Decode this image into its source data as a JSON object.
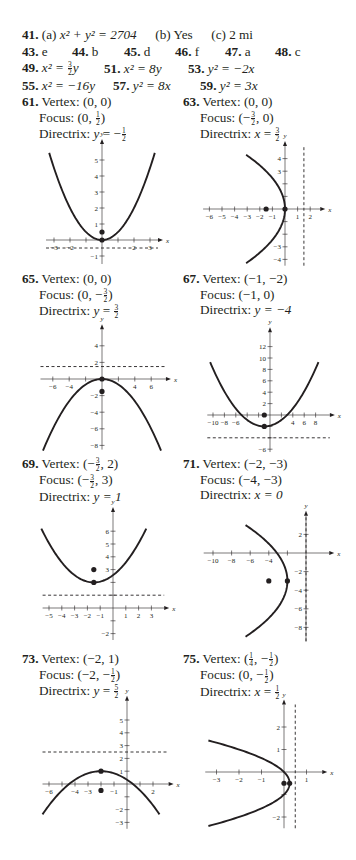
{
  "answers_top": {
    "row1": {
      "items": [
        {
          "num": "41.",
          "parts": [
            "(a)",
            "x² + y² = 2704",
            "(b) Yes",
            "(c) 2 mi"
          ]
        }
      ]
    },
    "row2": {
      "items": [
        {
          "num": "43.",
          "text": "e"
        },
        {
          "num": "44.",
          "text": "b"
        },
        {
          "num": "45.",
          "text": "d"
        },
        {
          "num": "46.",
          "text": "f"
        },
        {
          "num": "47.",
          "text": "a"
        },
        {
          "num": "48.",
          "text": "c"
        }
      ]
    },
    "row3": {
      "items": [
        {
          "num": "49.",
          "lhs": "x² = ",
          "frac_num": "3",
          "frac_den": "2",
          "rhs": "y"
        },
        {
          "num": "51.",
          "text": "x² = 8y"
        },
        {
          "num": "53.",
          "text": "y² = −2x"
        }
      ]
    },
    "row4": {
      "items": [
        {
          "num": "55.",
          "text": "x² = −16y"
        },
        {
          "num": "57.",
          "text": "y² = 8x"
        },
        {
          "num": "59.",
          "text": "y² = 3x"
        }
      ]
    }
  },
  "problems": [
    {
      "num": "61.",
      "vertex": "(0, 0)",
      "focus": {
        "pre": "(0, ",
        "frac_sign": "",
        "frac_num": "1",
        "frac_den": "2",
        "post": ")"
      },
      "directrix": {
        "var": "y",
        "eq": " = −",
        "frac_num": "1",
        "frac_den": "2"
      },
      "labels": {
        "vertex": "Vertex:",
        "focus": "Focus:",
        "directrix": "Directrix:"
      }
    },
    {
      "num": "63.",
      "vertex": "(0, 0)",
      "focus": {
        "pre": "(−",
        "frac_num": "3",
        "frac_den": "2",
        "post": ", 0)"
      },
      "directrix": {
        "var": "x",
        "eq": " = ",
        "frac_num": "3",
        "frac_den": "2"
      },
      "labels": {
        "vertex": "Vertex:",
        "focus": "Focus:",
        "directrix": "Directrix:"
      }
    },
    {
      "num": "65.",
      "vertex": "(0, 0)",
      "focus": {
        "pre": "(0, −",
        "frac_num": "3",
        "frac_den": "2",
        "post": ")"
      },
      "directrix": {
        "var": "y",
        "eq": " = ",
        "frac_num": "3",
        "frac_den": "2"
      },
      "labels": {
        "vertex": "Vertex:",
        "focus": "Focus:",
        "directrix": "Directrix:"
      }
    },
    {
      "num": "67.",
      "vertex": "(−1, −2)",
      "focus_text": "(−1, 0)",
      "directrix_text": "y = −4",
      "labels": {
        "vertex": "Vertex:",
        "focus": "Focus:",
        "directrix": "Directrix:"
      }
    },
    {
      "num": "69.",
      "vertex": {
        "pre": "(−",
        "frac_num": "3",
        "frac_den": "2",
        "post": ", 2)"
      },
      "focus": {
        "pre": "(−",
        "frac_num": "3",
        "frac_den": "2",
        "post": ", 3)"
      },
      "directrix_text": "y = 1",
      "labels": {
        "vertex": "Vertex:",
        "focus": "Focus:",
        "directrix": "Directrix:"
      }
    },
    {
      "num": "71.",
      "vertex": "(−2, −3)",
      "focus_text": "(−4, −3)",
      "directrix_text": "x = 0",
      "labels": {
        "vertex": "Vertex:",
        "focus": "Focus:",
        "directrix": "Directrix:"
      }
    },
    {
      "num": "73.",
      "vertex": "(−2, 1)",
      "focus": {
        "pre": "(−2, −",
        "frac_num": "1",
        "frac_den": "2",
        "post": ")"
      },
      "directrix": {
        "var": "y",
        "eq": " = ",
        "frac_num": "5",
        "frac_den": "2"
      },
      "labels": {
        "vertex": "Vertex:",
        "focus": "Focus:",
        "directrix": "Directrix:"
      }
    },
    {
      "num": "75.",
      "vertex": {
        "pre": "(",
        "frac_num": "1",
        "frac_den": "4",
        "post": ", −",
        "frac2_num": "1",
        "frac2_den": "2",
        "post2": ")"
      },
      "focus": {
        "pre": "(0, −",
        "frac_num": "1",
        "frac_den": "2",
        "post": ")"
      },
      "directrix": {
        "var": "x",
        "eq": " = ",
        "frac_num": "1",
        "frac_den": "2"
      },
      "labels": {
        "vertex": "Vertex:",
        "focus": "Focus:",
        "directrix": "Directrix:"
      }
    }
  ],
  "chart_data": [
    {
      "type": "line",
      "title": "61. x² = 2y",
      "orientation": "vertical",
      "a": 0.5,
      "h": 0,
      "k": 0,
      "vertex": [
        0,
        0
      ],
      "focus": [
        0,
        0.5
      ],
      "directrix": {
        "axis": "y",
        "value": -0.5
      },
      "x_ticks": [
        -3,
        -2,
        -1,
        1,
        2,
        3
      ],
      "x_tick_labels": [
        "-3",
        "-2",
        "2",
        "3"
      ],
      "x_labeled": [
        -3,
        -2,
        2,
        3
      ],
      "y_ticks": [
        -1,
        1,
        2,
        3,
        4,
        5
      ],
      "y_labeled": [
        -1,
        1,
        2,
        3,
        4,
        5
      ],
      "xlim": [
        -3.5,
        3.5
      ],
      "ylim": [
        -1.5,
        6
      ],
      "curve_range": [
        -3.3,
        3.3
      ],
      "xlabel": "x",
      "ylabel": "y"
    },
    {
      "type": "line",
      "title": "63. y² = -6x",
      "orientation": "horizontal",
      "a": -0.1667,
      "h": 0,
      "k": 0,
      "vertex": [
        0,
        0
      ],
      "focus": [
        -1.5,
        0
      ],
      "directrix": {
        "axis": "x",
        "value": 1.5
      },
      "x_ticks": [
        -6,
        -5,
        -4,
        -3,
        -2,
        -1,
        1,
        2
      ],
      "x_labeled": [
        -6,
        -5,
        -4,
        -3,
        -2,
        -1,
        1,
        2
      ],
      "y_ticks": [
        -4,
        -3,
        -2,
        -1,
        1,
        2,
        3,
        4
      ],
      "y_labeled": [
        -4,
        -3,
        3,
        4
      ],
      "xlim": [
        -6.5,
        2.8
      ],
      "ylim": [
        -4.5,
        5
      ],
      "curve_range": [
        -4.3,
        4.3
      ],
      "xlabel": "x",
      "ylabel": "y"
    },
    {
      "type": "line",
      "title": "65. x² = -6y",
      "orientation": "vertical",
      "a": -0.1667,
      "h": 0,
      "k": 0,
      "vertex": [
        0,
        0
      ],
      "focus": [
        0,
        -1.5
      ],
      "directrix": {
        "axis": "y",
        "value": 1.5
      },
      "x_ticks": [
        -6,
        -4,
        -2,
        2,
        4,
        6
      ],
      "x_labeled": [
        -6,
        -4,
        4,
        6
      ],
      "y_ticks": [
        -8,
        -6,
        -4,
        -2,
        2,
        4
      ],
      "y_labeled": [
        -8,
        -6,
        -4,
        -2,
        2,
        4
      ],
      "xlim": [
        -7.5,
        7.8
      ],
      "ylim": [
        -8.5,
        6
      ],
      "curve_range": [
        -7.2,
        7.2
      ],
      "xlabel": "x",
      "ylabel": "y"
    },
    {
      "type": "line",
      "title": "67. (x+1)² = 8(y+2)",
      "orientation": "vertical",
      "a": 0.125,
      "h": -1,
      "k": -2,
      "vertex": [
        -1,
        -2
      ],
      "focus": [
        -1,
        0
      ],
      "directrix": {
        "axis": "y",
        "value": -4
      },
      "x_ticks": [
        -10,
        -8,
        -6,
        -4,
        -2,
        2,
        4,
        6,
        8
      ],
      "x_labeled": [
        -10,
        -8,
        -6,
        4,
        6,
        8
      ],
      "y_ticks": [
        -6,
        -4,
        -2,
        2,
        4,
        6,
        8,
        10,
        12
      ],
      "y_labeled": [
        -6,
        2,
        4,
        6,
        8,
        10,
        12
      ],
      "xlim": [
        -11,
        10.5
      ],
      "ylim": [
        -6.5,
        14.5
      ],
      "curve_range": [
        -10.5,
        8.5
      ],
      "xlabel": "x",
      "ylabel": "y"
    },
    {
      "type": "line",
      "title": "69. (x+3/2)² = 4(y-2)",
      "orientation": "vertical",
      "a": 0.25,
      "h": -1.5,
      "k": 2,
      "vertex": [
        -1.5,
        2
      ],
      "focus": [
        -1.5,
        3
      ],
      "directrix": {
        "axis": "y",
        "value": 1
      },
      "x_ticks": [
        -5,
        -4,
        -3,
        -2,
        -1,
        1,
        2,
        3
      ],
      "x_labeled": [
        -5,
        -4,
        -3,
        -2,
        -1,
        1,
        2,
        3
      ],
      "y_ticks": [
        -2,
        -1,
        1,
        2,
        3,
        4,
        5,
        6
      ],
      "y_labeled": [
        -2,
        3,
        4,
        5,
        6
      ],
      "xlim": [
        -5.5,
        4
      ],
      "ylim": [
        -2.5,
        7.5
      ],
      "curve_range": [
        -5.6,
        2.6
      ],
      "xlabel": "x",
      "ylabel": "y"
    },
    {
      "type": "line",
      "title": "71. (y+3)² = -8(x+2)",
      "orientation": "horizontal",
      "a": -0.125,
      "h": -2,
      "k": -3,
      "vertex": [
        -2,
        -3
      ],
      "focus": [
        -4,
        -3
      ],
      "directrix": {
        "axis": "x",
        "value": 0
      },
      "x_ticks": [
        -10,
        -8,
        -6,
        -4,
        -2
      ],
      "x_labeled": [
        -10,
        -8,
        -6,
        -4
      ],
      "y_ticks": [
        -8,
        -6,
        -4,
        -2,
        2
      ],
      "y_labeled": [
        -8,
        -6,
        -4,
        -2,
        2
      ],
      "xlim": [
        -11,
        2.5
      ],
      "ylim": [
        -9.5,
        4
      ],
      "curve_range": [
        -9,
        3
      ],
      "xlabel": "x",
      "ylabel": "y"
    },
    {
      "type": "line",
      "title": "73. (x+2)² = -6(y-1)",
      "orientation": "vertical",
      "a": -0.1667,
      "h": -2,
      "k": 1,
      "vertex": [
        -2,
        1
      ],
      "focus": [
        -2,
        -0.5
      ],
      "directrix": {
        "axis": "y",
        "value": 2.5
      },
      "x_ticks": [
        -6,
        -5,
        -4,
        -3,
        -2,
        -1,
        1,
        2
      ],
      "x_labeled": [
        -6,
        -4,
        -3,
        -1,
        2
      ],
      "y_ticks": [
        -3,
        -2,
        -1,
        1,
        2,
        3,
        4,
        5
      ],
      "y_labeled": [
        -3,
        -2,
        1,
        2,
        3,
        4,
        5
      ],
      "xlim": [
        -6.5,
        3.2
      ],
      "ylim": [
        -3.5,
        6.5
      ],
      "curve_range": [
        -6.5,
        2.5
      ],
      "xlabel": "x",
      "ylabel": "y"
    },
    {
      "type": "line",
      "title": "75. (y+1/2)² = -(x-1/4)",
      "orientation": "horizontal",
      "a": -1,
      "h": 0.25,
      "k": -0.5,
      "vertex": [
        0.25,
        -0.5
      ],
      "focus": [
        0,
        -0.5
      ],
      "directrix": {
        "axis": "x",
        "value": 0.5
      },
      "x_ticks": [
        -3,
        -2,
        -1,
        1
      ],
      "x_labeled": [
        -3,
        -2,
        -1,
        1
      ],
      "y_ticks": [
        -2,
        -1,
        1,
        2
      ],
      "y_labeled": [
        -2,
        1,
        2
      ],
      "xlim": [
        -3.5,
        1.7
      ],
      "ylim": [
        -2.5,
        3
      ],
      "curve_range": [
        -2.4,
        1.4
      ],
      "xlabel": "x",
      "ylabel": "y"
    }
  ],
  "graph_layout": [
    {
      "ox": 102,
      "oy": 240,
      "ux": 16,
      "uy": 16,
      "left": 38,
      "top": 135,
      "w": 135,
      "h": 120
    },
    {
      "ox": 285,
      "oy": 209,
      "ux": 12.6,
      "uy": 12.6,
      "left": 200,
      "top": 140,
      "w": 156,
      "h": 125
    },
    {
      "ox": 102,
      "oy": 379,
      "ux": 8.2,
      "uy": 8.3,
      "left": 38,
      "top": 325,
      "w": 135,
      "h": 125
    },
    {
      "ox": 270,
      "oy": 415,
      "ux": 5.7,
      "uy": 5.7,
      "left": 200,
      "top": 325,
      "w": 156,
      "h": 127
    },
    {
      "ox": 113,
      "oy": 608,
      "ux": 12.8,
      "uy": 12.8,
      "left": 38,
      "top": 515,
      "w": 135,
      "h": 125
    },
    {
      "ox": 306,
      "oy": 553,
      "ux": 9.3,
      "uy": 9.3,
      "left": 200,
      "top": 510,
      "w": 156,
      "h": 140
    },
    {
      "ox": 127,
      "oy": 784,
      "ux": 13,
      "uy": 12.8,
      "left": 38,
      "top": 708,
      "w": 135,
      "h": 125
    },
    {
      "ox": 284,
      "oy": 772,
      "ux": 22.5,
      "uy": 22.5,
      "left": 200,
      "top": 705,
      "w": 156,
      "h": 130
    }
  ],
  "problem_layout": [
    {
      "left": 22,
      "top": 94
    },
    {
      "left": 183,
      "top": 94
    },
    {
      "left": 22,
      "top": 271
    },
    {
      "left": 183,
      "top": 271
    },
    {
      "left": 22,
      "top": 456
    },
    {
      "left": 183,
      "top": 456
    },
    {
      "left": 22,
      "top": 651
    },
    {
      "left": 183,
      "top": 651
    }
  ]
}
